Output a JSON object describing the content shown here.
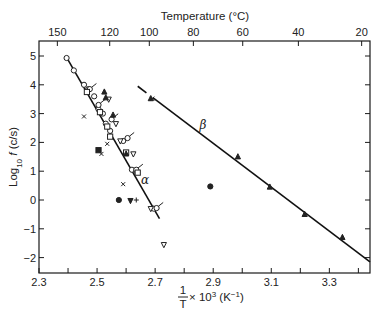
{
  "chart_data": {
    "type": "scatter",
    "title": "",
    "xlabel": "1/T × 10³ (K⁻¹)",
    "xlabel_parts": {
      "num": "1",
      "den": "T",
      "rest": " × 10",
      "sup": "3",
      "unit": " (K",
      "unit_sup": "−1",
      "close": ")"
    },
    "ylabel": "Log10 f (c/s)",
    "ylabel_parts": {
      "main": "Log",
      "sub": "10",
      "var": " f",
      "unit": " (c/s)"
    },
    "top_xlabel": "Temperature (°C)",
    "xlim": [
      2.3,
      3.44
    ],
    "ylim": [
      -2.55,
      5.5
    ],
    "x_ticks": [
      2.3,
      2.4,
      2.5,
      2.6,
      2.7,
      2.8,
      2.9,
      3.0,
      3.1,
      3.2,
      3.3,
      3.4
    ],
    "x_tick_labels": [
      "2.3",
      "2.5",
      "2.7",
      "2.9",
      "3.1",
      "3.3"
    ],
    "x_tick_label_values": [
      2.3,
      2.5,
      2.7,
      2.9,
      3.1,
      3.3
    ],
    "y_ticks": [
      5,
      4,
      3,
      2,
      1,
      0,
      -1,
      -2
    ],
    "y_tick_labels": [
      "5",
      "4",
      "3",
      "2",
      "1",
      "0",
      "−1",
      "−2"
    ],
    "top_ticks_celsius": [
      150,
      120,
      100,
      80,
      60,
      40,
      20
    ],
    "top_tick_labels": [
      "150",
      "120",
      "100",
      "80",
      "60",
      "40",
      "20"
    ],
    "grid": false,
    "legend": "none",
    "annotations": [
      {
        "text": "α",
        "x": 2.665,
        "y": 0.55
      },
      {
        "text": "β",
        "x": 2.865,
        "y": 2.45
      }
    ],
    "fit_lines": [
      {
        "name": "alpha",
        "x": [
          2.395,
          2.715
        ],
        "y": [
          4.95,
          -0.65
        ]
      },
      {
        "name": "beta",
        "x": [
          2.64,
          3.44
        ],
        "y": [
          3.95,
          -2.15
        ],
        "gap_at": [
          2.68,
          3.5
        ]
      }
    ],
    "series": [
      {
        "name": "open-circle",
        "marker": "circle-open",
        "points": [
          [
            2.395,
            4.93
          ],
          [
            2.42,
            4.5
          ],
          [
            2.455,
            4.0
          ],
          [
            2.47,
            3.85
          ],
          [
            2.49,
            3.6
          ],
          [
            2.505,
            3.15
          ],
          [
            2.52,
            3.0
          ],
          [
            2.53,
            2.65
          ],
          [
            2.545,
            2.4
          ],
          [
            2.59,
            2.05
          ],
          [
            2.62,
            1.05
          ],
          [
            2.695,
            -0.3
          ],
          [
            2.635,
            1.0
          ]
        ]
      },
      {
        "name": "open-circle-flag",
        "marker": "circle-open-flag",
        "points": [
          [
            2.475,
            3.85
          ],
          [
            2.505,
            3.3
          ],
          [
            2.55,
            2.8
          ],
          [
            2.605,
            2.15
          ],
          [
            2.635,
            1.05
          ],
          [
            2.705,
            -0.28
          ]
        ]
      },
      {
        "name": "open-square",
        "marker": "square-open",
        "points": [
          [
            2.465,
            3.75
          ],
          [
            2.51,
            3.05
          ],
          [
            2.535,
            2.55
          ],
          [
            2.545,
            2.2
          ],
          [
            2.6,
            1.65
          ],
          [
            2.64,
            0.95
          ]
        ]
      },
      {
        "name": "open-triangle-down",
        "marker": "triangle-down-open",
        "points": [
          [
            2.54,
            3.5
          ],
          [
            2.565,
            2.65
          ],
          [
            2.58,
            2.05
          ],
          [
            2.625,
            1.6
          ],
          [
            2.685,
            -0.3
          ],
          [
            2.73,
            -1.55
          ]
        ]
      },
      {
        "name": "filled-triangle",
        "marker": "triangle-filled",
        "points": [
          [
            2.525,
            3.75
          ],
          [
            2.53,
            3.55
          ],
          [
            2.555,
            2.95
          ],
          [
            2.6,
            1.6
          ],
          [
            2.685,
            3.52
          ],
          [
            2.985,
            1.5
          ],
          [
            3.095,
            0.45
          ],
          [
            3.215,
            -0.5
          ],
          [
            3.345,
            -1.3
          ]
        ]
      },
      {
        "name": "cross",
        "marker": "x",
        "points": [
          [
            2.455,
            2.9
          ],
          [
            2.515,
            1.6
          ],
          [
            2.535,
            1.95
          ],
          [
            2.59,
            0.55
          ],
          [
            2.69,
            3.52
          ]
        ]
      },
      {
        "name": "filled-square",
        "marker": "square-filled",
        "points": [
          [
            2.505,
            1.73
          ]
        ]
      },
      {
        "name": "filled-circle",
        "marker": "circle-filled",
        "points": [
          [
            2.575,
            0.0
          ],
          [
            2.89,
            0.47
          ]
        ]
      },
      {
        "name": "filled-triangle-down",
        "marker": "triangle-down-filled",
        "points": [
          [
            2.615,
            -0.02
          ]
        ]
      },
      {
        "name": "plus",
        "marker": "plus",
        "points": [
          [
            2.635,
            0.0
          ]
        ]
      }
    ]
  }
}
